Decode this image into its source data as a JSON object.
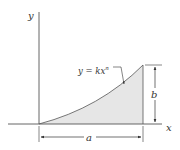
{
  "diagram": {
    "axes": {
      "x_label": "x",
      "y_label": "y"
    },
    "curve": {
      "equation_lhs": "y = kx",
      "equation_exp": "n"
    },
    "dimensions": {
      "width_label": "a",
      "height_label": "b"
    },
    "colors": {
      "line": "#333333",
      "fill": "#e6e6e6",
      "axis": "#555555"
    }
  }
}
